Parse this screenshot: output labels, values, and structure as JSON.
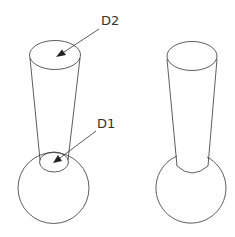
{
  "figure": {
    "left_part": {
      "name": "Tapered stem on sphere (hidden lines visible)",
      "labels": [
        {
          "id": "d2",
          "text": "D2"
        },
        {
          "id": "d1",
          "text": "D1"
        }
      ]
    },
    "right_part": {
      "name": "Tapered stem on sphere (solid view)"
    },
    "colors": {
      "line": "#333333",
      "background": "#ffffff"
    }
  }
}
